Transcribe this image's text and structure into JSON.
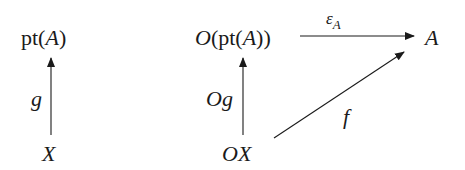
{
  "diagram": {
    "left": {
      "top_node": {
        "prefix": "pt(",
        "var": "A",
        "suffix": ")"
      },
      "bottom_node": {
        "var": "X"
      },
      "arrow_label": "g"
    },
    "right": {
      "top_left_node": {
        "prefix_var": "O",
        "open": "(pt(",
        "var": "A",
        "close": "))"
      },
      "top_right_node": {
        "var": "A"
      },
      "bottom_node": {
        "prefix_var": "O",
        "var": "X"
      },
      "vertical_arrow_label": {
        "var1": "O",
        "var2": "g"
      },
      "horizontal_arrow_label": {
        "main": "ε",
        "sub": "A"
      },
      "diagonal_arrow_label": "f"
    },
    "colors": {
      "ink": "#1a1a1a",
      "background": "#ffffff"
    }
  }
}
